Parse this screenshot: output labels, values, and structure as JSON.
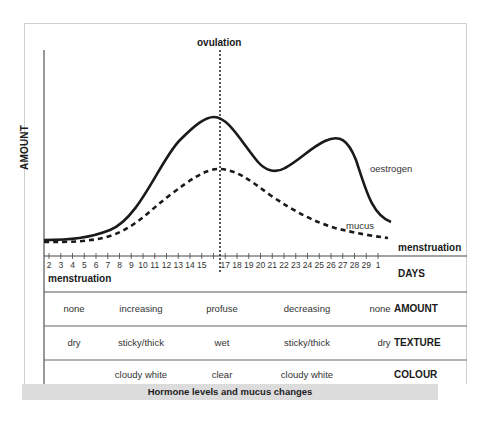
{
  "chart_data": {
    "type": "line",
    "title": "Hormone levels and mucus changes",
    "xlabel": "DAYS",
    "ylabel": "AMOUNT",
    "x": [
      2,
      3,
      4,
      5,
      6,
      7,
      8,
      9,
      10,
      11,
      12,
      13,
      14,
      15,
      16,
      17,
      18,
      19,
      20,
      21,
      22,
      23,
      24,
      25,
      26,
      27,
      28,
      29,
      1
    ],
    "x_tick_labels": [
      "2",
      "3",
      "4",
      "5",
      "6",
      "7",
      "8",
      "9",
      "10",
      "11",
      "12",
      "13",
      "14",
      "15",
      "17",
      "18",
      "19",
      "20",
      "21",
      "22",
      "23",
      "24",
      "25",
      "26",
      "27",
      "28",
      "29",
      "1"
    ],
    "series": [
      {
        "name": "oestrogen",
        "style": "solid",
        "values": [
          3,
          3,
          3.5,
          4,
          5,
          7,
          11,
          18,
          27,
          37,
          47,
          56,
          63,
          67,
          63,
          53,
          42,
          36,
          36,
          39,
          42,
          46,
          49,
          50,
          48,
          38,
          22,
          12,
          9
        ]
      },
      {
        "name": "mucus",
        "style": "dashed",
        "values": [
          2,
          2,
          2.5,
          3,
          4,
          5,
          8,
          12,
          17,
          23,
          29,
          35,
          40,
          43,
          44,
          42,
          38,
          33,
          28,
          24,
          20,
          17,
          14,
          11,
          9,
          7,
          6,
          5,
          4
        ]
      }
    ],
    "annotations": [
      {
        "text": "ovulation",
        "x": 16,
        "style": "dotted vertical line"
      },
      {
        "text": "menstruation",
        "position": "start of cycle (days 2-7)"
      },
      {
        "text": "menstruation",
        "position": "end of cycle (day 1)"
      }
    ],
    "ylim": [
      0,
      100
    ],
    "grid": false,
    "legend": "inline labels",
    "table": {
      "rows": [
        {
          "label": "AMOUNT",
          "values": [
            "none",
            "increasing",
            "profuse",
            "decreasing",
            "none"
          ]
        },
        {
          "label": "TEXTURE",
          "values": [
            "dry",
            "sticky/thick",
            "wet",
            "sticky/thick",
            "dry"
          ]
        },
        {
          "label": "COLOUR",
          "values": [
            "",
            "cloudy white",
            "clear",
            "cloudy white",
            ""
          ]
        }
      ]
    }
  },
  "labels": {
    "ylabel": "AMOUNT",
    "ovulation": "ovulation",
    "oestrogen": "oestrogen",
    "mucus": "mucus",
    "menstruation_right": "menstruation",
    "menstruation_left": "menstruation",
    "days": "DAYS",
    "caption": "Hormone levels and mucus changes"
  },
  "table": {
    "amount": {
      "label": "AMOUNT",
      "c0": "none",
      "c1": "increasing",
      "c2": "profuse",
      "c3": "decreasing",
      "c4": "none"
    },
    "texture": {
      "label": "TEXTURE",
      "c0": "dry",
      "c1": "sticky/thick",
      "c2": "wet",
      "c3": "sticky/thick",
      "c4": "dry"
    },
    "colour": {
      "label": "COLOUR",
      "c0": "",
      "c1": "cloudy white",
      "c2": "clear",
      "c3": "cloudy white",
      "c4": ""
    }
  },
  "ticks": [
    "2",
    "3",
    "4",
    "5",
    "6",
    "7",
    "8",
    "9",
    "10",
    "11",
    "12",
    "13",
    "14",
    "15",
    "",
    "17",
    "18",
    "19",
    "20",
    "21",
    "22",
    "23",
    "24",
    "25",
    "26",
    "27",
    "28",
    "29",
    "1"
  ]
}
